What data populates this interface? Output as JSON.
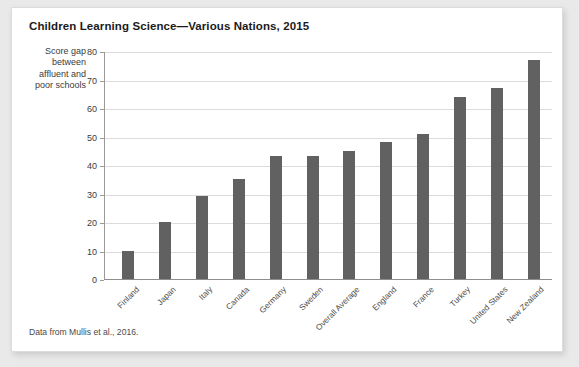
{
  "chart_data": {
    "type": "bar",
    "title": "Children Learning Science—Various Nations, 2015",
    "xlabel": "",
    "ylabel": "Score gap between affluent and poor schools",
    "ylim": [
      0,
      80
    ],
    "yticks": [
      0,
      10,
      20,
      30,
      40,
      50,
      60,
      70,
      80
    ],
    "grid": true,
    "legend": "none",
    "bar_color": "#616161",
    "categories": [
      "Finland",
      "Japan",
      "Italy",
      "Canada",
      "Germany",
      "Sweden",
      "Overall Average",
      "England",
      "France",
      "Turkey",
      "United States",
      "New Zealand"
    ],
    "values": [
      10,
      20,
      29,
      35,
      43,
      43,
      45,
      48,
      51,
      64,
      67,
      77
    ],
    "source_note": "Data from Mullis et al., 2016."
  },
  "figure": {
    "title": "Children Learning Science—Various Nations, 2015",
    "ylabel_lines": [
      "Score gap",
      "between",
      "affluent and",
      "poor schools"
    ],
    "source_note": "Data from Mullis et al., 2016."
  }
}
